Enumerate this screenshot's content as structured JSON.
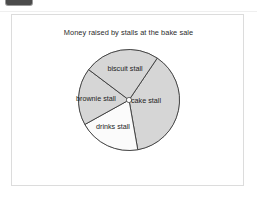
{
  "window": {
    "background_color": "#ffffff",
    "top_crop_bar_color": "#4b4b4b"
  },
  "card": {
    "border_color": "#dcdcdc",
    "background_color": "#ffffff"
  },
  "chart_data": {
    "type": "pie",
    "title": "Money raised by stalls at the bake sale",
    "labels": [
      "cake stall",
      "drinks stall",
      "brownie stall",
      "biscuit stall"
    ],
    "values": [
      136,
      71,
      66,
      87
    ],
    "value_unit": "degrees",
    "start_angle_deg_from_12oclock": 34,
    "direction": "clockwise",
    "slices": [
      {
        "label": "cake stall",
        "angle_deg": 136,
        "start_deg": 34,
        "end_deg": 170,
        "fill": "#d6d6d6",
        "stroke": "#3a3a3a",
        "label_x": 76,
        "label_y": 62
      },
      {
        "label": "drinks stall",
        "angle_deg": 71,
        "start_deg": 170,
        "end_deg": 241,
        "fill": "#fbfbfb",
        "stroke": "#3a3a3a",
        "label_x": 43,
        "label_y": 88
      },
      {
        "label": "brownie stall",
        "angle_deg": 66,
        "start_deg": 241,
        "end_deg": 307,
        "fill": "#d6d6d6",
        "stroke": "#3a3a3a",
        "label_x": 26,
        "label_y": 60
      },
      {
        "label": "biscuit stall",
        "angle_deg": 87,
        "start_deg": 307,
        "end_deg": 34,
        "fill": "#d6d6d6",
        "stroke": "#3a3a3a",
        "label_x": 55,
        "label_y": 30
      }
    ],
    "legend": "none",
    "grid": false,
    "xlabel": "",
    "ylabel": ""
  }
}
